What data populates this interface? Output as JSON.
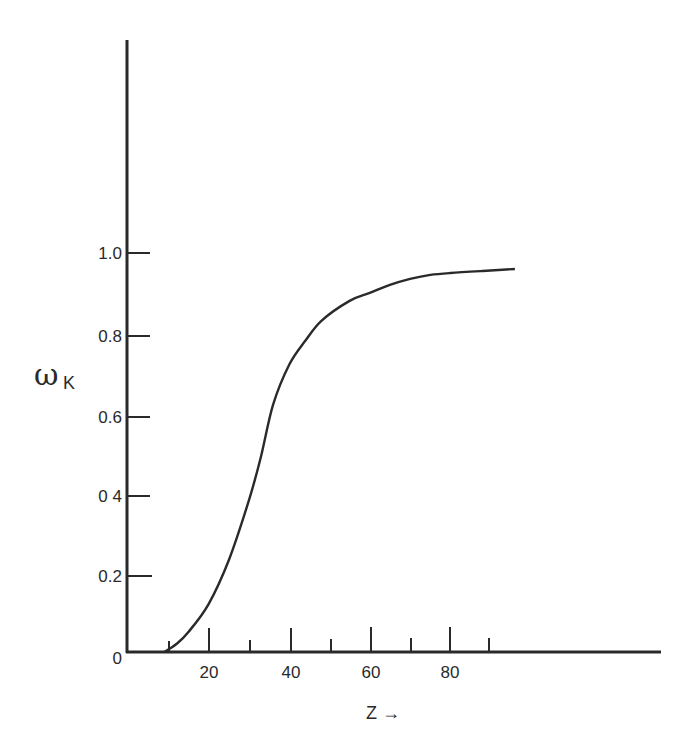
{
  "chart_data": {
    "type": "line",
    "title": "",
    "xlabel": "Z →",
    "ylabel": "ωK",
    "ylabel_main": "ω",
    "ylabel_sub": "K",
    "xlim": [
      0,
      130
    ],
    "ylim": [
      0,
      1.5
    ],
    "grid": false,
    "legend": null,
    "x_ticks_major": [
      20,
      40,
      60,
      80
    ],
    "x_ticks_minor": [
      10,
      30,
      50,
      70,
      90
    ],
    "x_tick_labels": [
      "20",
      "40",
      "60",
      "80"
    ],
    "y_ticks": [
      0,
      0.2,
      0.4,
      0.6,
      0.8,
      1.0
    ],
    "y_tick_labels": [
      "0",
      "0.2",
      "0 4",
      "0.6",
      "0.8",
      "1.0"
    ],
    "series": [
      {
        "name": "ωK",
        "x": [
          9,
          12,
          15,
          20,
          25,
          30,
          33,
          36,
          40,
          44,
          48,
          55,
          60,
          65,
          70,
          75,
          80,
          88,
          96
        ],
        "y": [
          0.0,
          0.02,
          0.05,
          0.12,
          0.23,
          0.38,
          0.49,
          0.62,
          0.72,
          0.78,
          0.83,
          0.88,
          0.9,
          0.92,
          0.935,
          0.945,
          0.95,
          0.955,
          0.96
        ]
      }
    ]
  },
  "axes": {
    "origin_label": "0",
    "y_labels": [
      "1.0",
      "0.8",
      "0.6",
      "0 4",
      "0.2"
    ],
    "x_labels": [
      "20",
      "40",
      "60",
      "80"
    ],
    "x_title": "Z →"
  }
}
